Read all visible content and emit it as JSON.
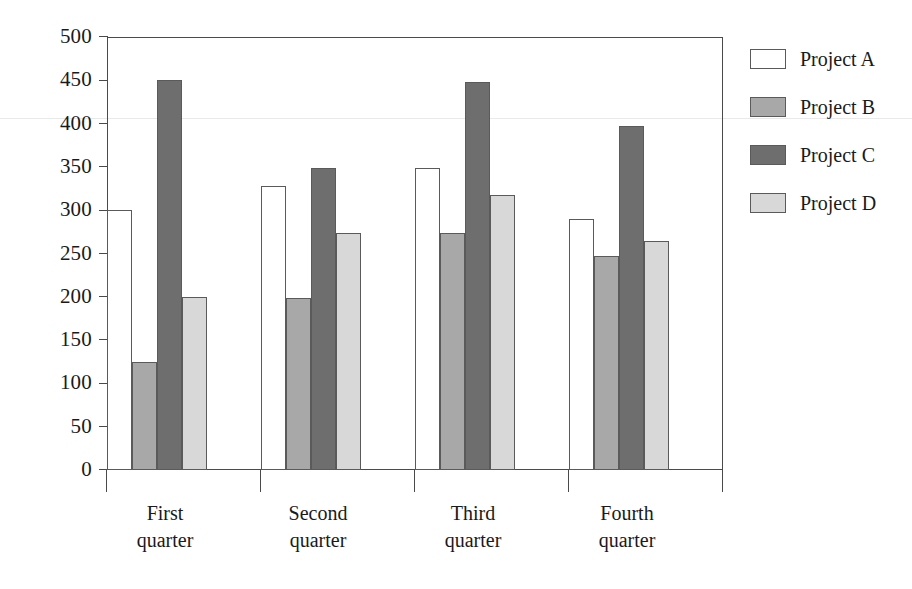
{
  "chart_data": {
    "type": "bar",
    "title": "",
    "subtitle": "",
    "xlabel": "",
    "ylabel": "",
    "categories": [
      "First quarter",
      "Second quarter",
      "Third quarter",
      "Fourth quarter"
    ],
    "category_lines": [
      [
        "First",
        "quarter"
      ],
      [
        "Second",
        "quarter"
      ],
      [
        "Third",
        "quarter"
      ],
      [
        "Fourth",
        "quarter"
      ]
    ],
    "series": [
      {
        "name": "Project A",
        "color": "#ffffff",
        "values": [
          300,
          328,
          349,
          290
        ]
      },
      {
        "name": "Project B",
        "color": "#a8a8a8",
        "values": [
          125,
          199,
          274,
          247
        ]
      },
      {
        "name": "Project C",
        "color": "#6e6e6e",
        "values": [
          450,
          349,
          448,
          397
        ]
      },
      {
        "name": "Project D",
        "color": "#d8d8d8",
        "values": [
          200,
          274,
          318,
          265
        ]
      }
    ],
    "ylim": [
      0,
      500
    ],
    "ytick_values": [
      0,
      50,
      100,
      150,
      200,
      250,
      300,
      350,
      400,
      450,
      500
    ],
    "ytick_labels": [
      "0",
      "50",
      "100",
      "150",
      "200",
      "250",
      "300",
      "350",
      "400",
      "450",
      "500"
    ],
    "grid": false,
    "legend_position": "right",
    "bar_border_color": "#5a5a5a",
    "axis_color": "#4a4a4a"
  },
  "legend": {
    "items": [
      {
        "label": "Project A"
      },
      {
        "label": "Project B"
      },
      {
        "label": "Project C"
      },
      {
        "label": "Project D"
      }
    ]
  }
}
